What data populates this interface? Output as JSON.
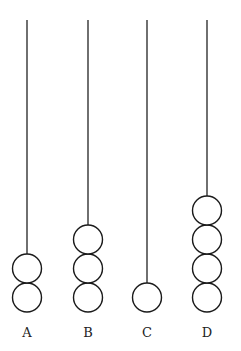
{
  "diagram": {
    "type": "abacus-rods",
    "rod_top_y": 20,
    "base_y": 312,
    "bead_radius": 14.5,
    "bead_spacing": 29,
    "colors": {
      "line": "#222222",
      "bead_fill": "#ffffff",
      "background": "#ffffff"
    },
    "rods": [
      {
        "label": "A",
        "x": 27,
        "beads": 2
      },
      {
        "label": "B",
        "x": 88,
        "beads": 3
      },
      {
        "label": "C",
        "x": 147,
        "beads": 1
      },
      {
        "label": "D",
        "x": 207,
        "beads": 4
      }
    ]
  }
}
